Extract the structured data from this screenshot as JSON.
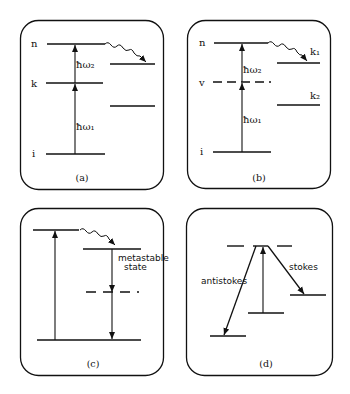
{
  "panels": {
    "a": {
      "caption": "(a)",
      "levels": {
        "n": "n",
        "k": "k",
        "i": "i"
      },
      "transitions": {
        "lower": "ħω₁",
        "upper": "ħω₂"
      }
    },
    "b": {
      "caption": "(b)",
      "levels": {
        "n": "n",
        "v": "v",
        "i": "i",
        "k1": "k₁",
        "k2": "k₂"
      },
      "transitions": {
        "lower": "ħω₁",
        "upper": "ħω₂"
      }
    },
    "c": {
      "caption": "(c)",
      "labels": {
        "metastable_line1": "metastable",
        "metastable_line2": "state"
      }
    },
    "d": {
      "caption": "(d)",
      "labels": {
        "antistokes": "antistokes",
        "stokes": "stokes"
      }
    }
  },
  "colors": {
    "ink": "#111111",
    "background": "#ffffff"
  }
}
